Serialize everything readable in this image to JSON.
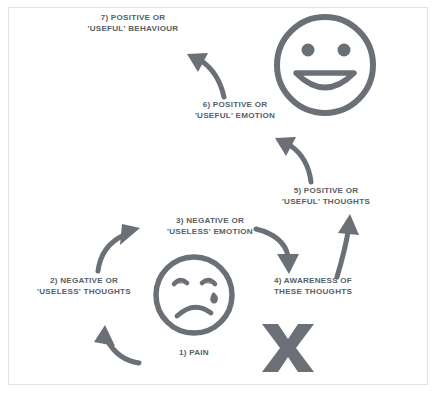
{
  "diagram": {
    "title_text_color": "#595e66",
    "ink_color": "#6b7077",
    "border_color": "#e3e3e3",
    "background_color": "#ffffff",
    "steps": [
      {
        "id": "step-1",
        "label": "1) PAIN"
      },
      {
        "id": "step-2",
        "label": "2) NEGATIVE OR\n'USELESS' THOUGHTS"
      },
      {
        "id": "step-3",
        "label": "3) NEGATIVE OR\n'USELESS' EMOTION"
      },
      {
        "id": "step-4",
        "label": "4) AWARENESS OF\nTHESE THOUGHTS"
      },
      {
        "id": "step-5",
        "label": "5) POSITIVE OR\n'USEFUL' THOUGHTS"
      },
      {
        "id": "step-6",
        "label": "6) POSITIVE OR\n'USEFUL' EMOTION"
      },
      {
        "id": "step-7",
        "label": "7) POSITIVE OR\n'USEFUL' BEHAVIOUR"
      }
    ],
    "icons": [
      {
        "id": "smiley-face-icon",
        "name": "smiling-face-icon"
      },
      {
        "id": "sad-face-icon",
        "name": "crying-sad-face-icon"
      },
      {
        "id": "x-mark-icon",
        "name": "x-mark-icon"
      }
    ],
    "arrows": [
      {
        "id": "arrow-pain-to-negative-thoughts",
        "direction": "up-left"
      },
      {
        "id": "arrow-negative-thoughts-to-negative-emotion",
        "direction": "up-right"
      },
      {
        "id": "arrow-negative-emotion-to-awareness",
        "direction": "down-right"
      },
      {
        "id": "arrow-awareness-to-positive-thoughts",
        "direction": "up"
      },
      {
        "id": "arrow-positive-thoughts-to-positive-emotion",
        "direction": "up-left"
      },
      {
        "id": "arrow-positive-emotion-to-positive-behaviour",
        "direction": "up-left"
      }
    ]
  }
}
